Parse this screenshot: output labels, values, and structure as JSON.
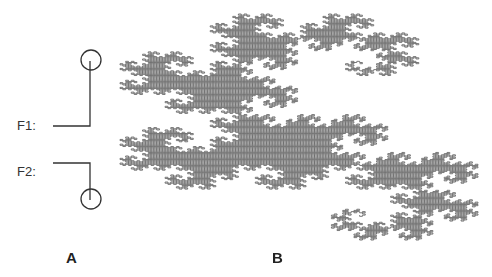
{
  "figure": {
    "panel_a": {
      "label": "A",
      "folds": [
        {
          "label": "F1:",
          "description": "horizontal segment turning up into a vertical segment ending in a circle"
        },
        {
          "label": "F2:",
          "description": "horizontal segment turning down into a vertical segment ending in a circle"
        }
      ]
    },
    "panel_b": {
      "label": "B",
      "content": "dragon-curve fractal",
      "iterations": 14
    },
    "colors": {
      "ink": "#333333",
      "fractal": "#6a6a6a",
      "background": "#ffffff"
    }
  }
}
